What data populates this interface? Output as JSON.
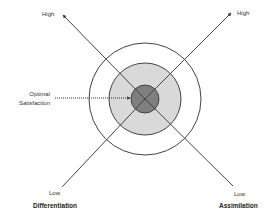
{
  "diagram": {
    "type": "concentric-target",
    "center": [
      145,
      99
    ],
    "colors": {
      "line": "#444444",
      "mid_fill": "#d9d9d9",
      "inner_fill": "#7f7f7f",
      "background": "#ffffff"
    },
    "rings": [
      {
        "name": "outer",
        "radius": 56,
        "fill": "none"
      },
      {
        "name": "middle",
        "radius": 36,
        "fill": "#d9d9d9"
      },
      {
        "name": "inner",
        "radius": 14,
        "fill": "#7f7f7f"
      }
    ],
    "axes": [
      {
        "name": "differentiation",
        "from": [
          62,
          187
        ],
        "to": [
          63,
          15
        ],
        "low_label": "Low",
        "high_label": "High",
        "axis_label": "Differentiation"
      },
      {
        "name": "assimilation",
        "from": [
          233,
          186
        ],
        "to": [
          231,
          13
        ],
        "low_label": "Low",
        "high_label": "High",
        "axis_label": "Assimilation"
      }
    ],
    "callout": {
      "text_line1": "Optimal",
      "text_line2": "Satisfaction",
      "arrow_from": [
        55,
        98
      ],
      "arrow_to": [
        131,
        98
      ],
      "style": "dotted"
    }
  },
  "labels": {
    "top_left_high": "High",
    "top_right_high": "High",
    "bottom_left_low": "Low",
    "bottom_right_low": "Low",
    "differentiation": "Differentiation",
    "assimilation": "Assimilation",
    "optimal": "Optimal",
    "satisfaction": "Satisfaction"
  }
}
